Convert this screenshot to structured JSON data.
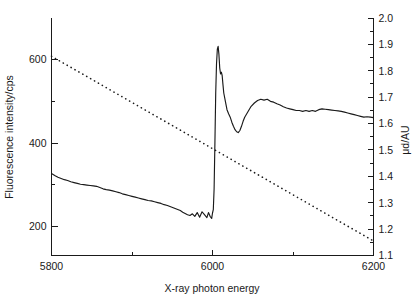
{
  "chart_data": {
    "type": "line",
    "title": "",
    "xlabel": "X-ray photon energy",
    "ylabel": "Fluorescence intensity/cps",
    "ylabel_right": "μd/AU",
    "xlim": [
      5800,
      6200
    ],
    "ylim": [
      130,
      700
    ],
    "ylim_right": [
      1.1,
      2.0
    ],
    "grid": false,
    "legend": "none",
    "x_ticks_major": [
      5800,
      6000,
      6200
    ],
    "x_ticks_minor": [
      5900,
      6100
    ],
    "x_tick_labels": [
      "5800",
      "6000",
      "6200"
    ],
    "y_ticks_major": [
      200,
      400,
      600
    ],
    "y_ticks_minor": [
      300,
      500
    ],
    "y_tick_labels": [
      "200",
      "400",
      "600"
    ],
    "y_right_ticks": [
      1.1,
      1.2,
      1.3,
      1.4,
      1.5,
      1.6,
      1.7,
      1.8,
      1.9,
      2.0
    ],
    "y_right_tick_labels": [
      "1.1",
      "1.2",
      "1.3",
      "1.4",
      "1.5",
      "1.6",
      "1.7",
      "1.8",
      "1.9",
      "2.0"
    ],
    "series": [
      {
        "name": "Fluorescence intensity",
        "style": "solid",
        "axis": "left",
        "color": "#1a1a1a",
        "x": [
          5800,
          5804,
          5808,
          5812,
          5816,
          5820,
          5824,
          5828,
          5832,
          5836,
          5840,
          5844,
          5848,
          5852,
          5856,
          5860,
          5864,
          5868,
          5872,
          5876,
          5880,
          5884,
          5888,
          5892,
          5896,
          5900,
          5904,
          5908,
          5912,
          5916,
          5920,
          5924,
          5928,
          5932,
          5936,
          5940,
          5944,
          5948,
          5952,
          5956,
          5960,
          5963,
          5966,
          5969,
          5972,
          5975,
          5978,
          5981,
          5984,
          5987,
          5990,
          5993,
          5995,
          5997,
          5999,
          6000,
          6001,
          6002,
          6003,
          6004,
          6005,
          6006,
          6007,
          6008,
          6009,
          6010,
          6011,
          6012,
          6013,
          6014,
          6016,
          6018,
          6020,
          6022,
          6024,
          6026,
          6028,
          6030,
          6032,
          6034,
          6036,
          6038,
          6040,
          6044,
          6048,
          6052,
          6056,
          6060,
          6064,
          6068,
          6072,
          6076,
          6080,
          6084,
          6088,
          6092,
          6096,
          6100,
          6104,
          6108,
          6112,
          6116,
          6120,
          6124,
          6128,
          6132,
          6136,
          6140,
          6144,
          6148,
          6152,
          6156,
          6160,
          6164,
          6168,
          6172,
          6176,
          6180,
          6184,
          6188,
          6192,
          6196,
          6200
        ],
        "y": [
          327,
          322,
          318,
          315,
          312,
          310,
          307,
          305,
          303,
          301,
          300,
          299,
          298,
          297,
          296,
          293,
          290,
          288,
          287,
          285,
          283,
          281,
          278,
          276,
          274,
          272,
          270,
          268,
          266,
          264,
          262,
          261,
          259,
          257,
          255,
          252,
          250,
          247,
          244,
          241,
          238,
          234,
          231,
          228,
          226,
          230,
          224,
          233,
          222,
          235,
          228,
          221,
          233,
          224,
          219,
          232,
          240,
          290,
          400,
          520,
          590,
          625,
          632,
          612,
          580,
          566,
          570,
          562,
          540,
          520,
          500,
          480,
          470,
          462,
          450,
          440,
          432,
          427,
          425,
          430,
          440,
          452,
          462,
          475,
          488,
          496,
          502,
          505,
          503,
          505,
          500,
          498,
          494,
          491,
          487,
          484,
          482,
          480,
          478,
          478,
          476,
          478,
          476,
          478,
          476,
          480,
          482,
          481,
          480,
          479,
          478,
          477,
          476,
          474,
          472,
          470,
          468,
          466,
          464,
          462,
          463,
          462,
          461
        ]
      },
      {
        "name": "μd",
        "style": "dotted",
        "axis": "right",
        "color": "#1a1a1a",
        "x": [
          5800,
          6200
        ],
        "y": [
          1.855,
          1.155
        ]
      }
    ]
  },
  "figure": {
    "background": "#ffffff",
    "foreground": "#1a1a1a"
  }
}
